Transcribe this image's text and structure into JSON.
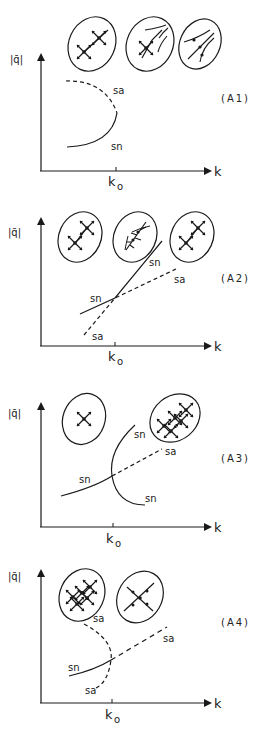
{
  "figure": {
    "panels": [
      {
        "id": "A1",
        "label": "(A1)",
        "y_axis": "|q̄|",
        "x_axis": "k",
        "tick": "k",
        "tick_sub": "o",
        "curves": [
          {
            "label": "sa",
            "style": "dashed"
          },
          {
            "label": "sn",
            "style": "solid"
          }
        ],
        "insets": [
          "separatrix-cross-pair",
          "branching-saddle-node",
          "cusp-flow"
        ]
      },
      {
        "id": "A2",
        "label": "(A2)",
        "y_axis": "|q̄|",
        "x_axis": "k",
        "tick": "k",
        "tick_sub": "o",
        "curves": [
          {
            "label": "sn",
            "style": "solid"
          },
          {
            "label": "sa",
            "style": "dashed"
          },
          {
            "label": "sn",
            "style": "solid"
          },
          {
            "label": "sa",
            "style": "dashed"
          }
        ],
        "insets": [
          "separatrix-cross-pair",
          "branching-node",
          "separatrix-cross-pair"
        ]
      },
      {
        "id": "A3",
        "label": "(A3)",
        "y_axis": "|q̄|",
        "x_axis": "k",
        "tick": "k",
        "tick_sub": "o",
        "curves": [
          {
            "label": "sn",
            "style": "solid"
          },
          {
            "label": "sa",
            "style": "dashed"
          },
          {
            "label": "sn",
            "style": "solid"
          },
          {
            "label": "sn",
            "style": "solid"
          }
        ],
        "insets": [
          "single-saddle",
          "saddle-grid"
        ]
      },
      {
        "id": "A4",
        "label": "(A4)",
        "y_axis": "|q̄|",
        "x_axis": "k",
        "tick": "k",
        "tick_sub": "o",
        "curves": [
          {
            "label": "sa",
            "style": "dashed"
          },
          {
            "label": "sa",
            "style": "dashed"
          },
          {
            "label": "sn",
            "style": "solid"
          },
          {
            "label": "sa",
            "style": "dashed"
          }
        ],
        "insets": [
          "saddle-grid",
          "single-saddle"
        ]
      }
    ]
  },
  "colors": {
    "ink": "#1a1a1a",
    "paper": "#ffffff"
  }
}
